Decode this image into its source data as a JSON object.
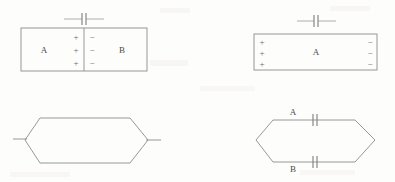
{
  "sheet": {
    "title": "Dielectric slab charge diagrams",
    "background_color": "#fdfdfc",
    "ink_color": "#8c8c8c",
    "text_color": "#4a4a4a",
    "width": 395,
    "height": 182
  },
  "figures": [
    {
      "id": "top-left",
      "shape": "rectangle-divided",
      "description": "Rectangle split by a vertical line, labelled A on the left and B on the right, with a column of plus signs left of the divider and minus signs right of it, capacitor symbol above.",
      "labels": {
        "left": "A",
        "right": "B"
      },
      "charges": {
        "left_column": [
          "+",
          "+",
          "+"
        ],
        "right_column": [
          "−",
          "−",
          "−"
        ]
      },
      "symbol": "capacitor-icon",
      "symbol_position": "above-center"
    },
    {
      "id": "top-right",
      "shape": "rectangle",
      "description": "Single rectangle labelled A with plus signs along the inner left edge and minus signs along the inner right edge, capacitor symbol above.",
      "labels": {
        "center": "A"
      },
      "charges": {
        "left_column": [
          "+",
          "+",
          "+"
        ],
        "right_column": [
          "−",
          "−",
          "−"
        ]
      },
      "symbol": "capacitor-icon",
      "symbol_position": "above-center"
    },
    {
      "id": "bottom-left",
      "shape": "hexagon",
      "description": "Elongated hexagon loop with short horizontal terminal stubs at the left and right vertices.",
      "labels": {},
      "terminals": [
        "left-stub",
        "right-stub"
      ]
    },
    {
      "id": "bottom-right",
      "shape": "hexagon",
      "description": "Elongated hexagon loop with a capacitor symbol on the top edge labelled A and a capacitor symbol on the bottom edge labelled B.",
      "labels": {
        "top": "A",
        "bottom": "B"
      },
      "symbols": [
        "capacitor-icon",
        "capacitor-icon"
      ]
    }
  ]
}
